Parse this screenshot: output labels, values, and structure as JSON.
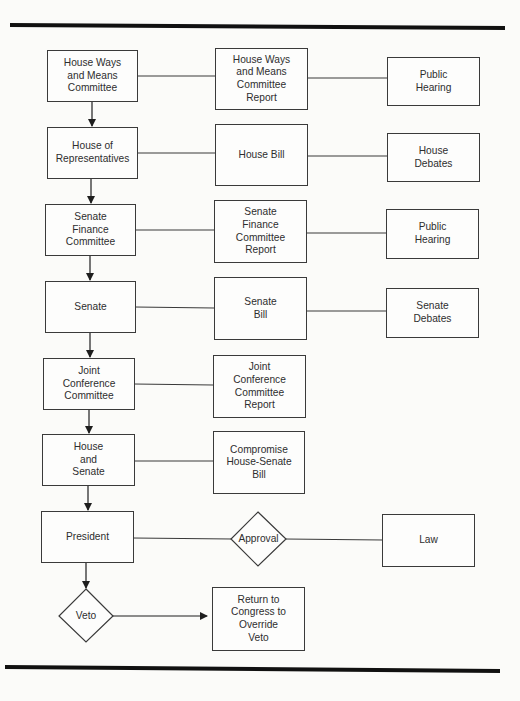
{
  "diagram": {
    "type": "flowchart",
    "colors": {
      "background": "#fbfbf9",
      "stroke": "#3a3a3a",
      "rule": "#111111",
      "text": "#2e2e2e"
    },
    "rows": [
      {
        "left": "House Ways\nand Means\nCommittee",
        "middle": "House Ways\nand Means\nCommittee\nReport",
        "right": "Public\nHearing"
      },
      {
        "left": "House of\nRepresentatives",
        "middle": "House Bill",
        "right": "House\nDebates"
      },
      {
        "left": "Senate\nFinance\nCommittee",
        "middle": "Senate\nFinance\nCommittee\nReport",
        "right": "Public\nHearing"
      },
      {
        "left": "Senate",
        "middle": "Senate\nBill",
        "right": "Senate\nDebates"
      },
      {
        "left": "Joint\nConference\nCommittee",
        "middle": "Joint\nConference\nCommittee\nReport"
      },
      {
        "left": "House\nand\nSenate",
        "middle": "Compromise\nHouse-Senate\nBill"
      },
      {
        "left": "President",
        "decision": "Approval",
        "right": "Law"
      }
    ],
    "veto": {
      "decision": "Veto",
      "outcome": "Return to\nCongress to\nOverride\nVeto"
    }
  }
}
